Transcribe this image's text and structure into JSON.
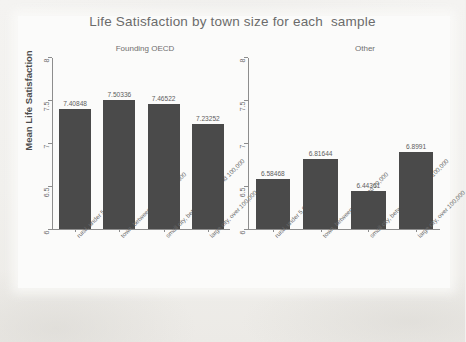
{
  "chart_data": {
    "type": "bar",
    "title": "Life Satisfaction by town size for each  sample",
    "xlabel": "",
    "ylabel": "Mean Life Satisfaction",
    "ylim": [
      6,
      8
    ],
    "yticks": [
      "6",
      "6.5",
      "7",
      "7.5",
      "8"
    ],
    "grid": false,
    "legend": "none",
    "categories": [
      "rural, under 5,000",
      "town, between 5,000 and 20,000",
      "small city, between 20,000 and 100,000",
      "large city, over 100,000"
    ],
    "panels": [
      {
        "name": "Founding OECD",
        "values": [
          7.40848,
          7.50336,
          7.46522,
          7.23252
        ],
        "labels": [
          "7.40848",
          "7.50336",
          "7.46522",
          "7.23252"
        ]
      },
      {
        "name": "Other",
        "values": [
          6.58468,
          6.81644,
          6.44361,
          6.8991
        ],
        "labels": [
          "6.58468",
          "6.81644",
          "6.44361",
          "6.8991"
        ]
      }
    ],
    "series": [
      {
        "name": "Founding OECD",
        "values": [
          7.40848,
          7.50336,
          7.46522,
          7.23252
        ]
      },
      {
        "name": "Other",
        "values": [
          6.58468,
          6.81644,
          6.44361,
          6.8991
        ]
      }
    ],
    "bar_color": "#4a4a4a",
    "axis_color": "#8d8d8d",
    "background_color": "#f2f1ef"
  }
}
